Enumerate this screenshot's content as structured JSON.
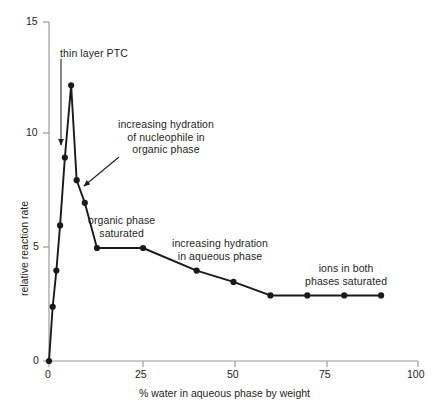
{
  "chart_data": {
    "type": "line",
    "title": "",
    "xlabel": "% water in aqueous phase by weight",
    "ylabel": "relative reaction rate",
    "xlim": [
      0,
      100
    ],
    "ylim": [
      0,
      15
    ],
    "xticks": [
      0,
      25,
      50,
      75,
      100
    ],
    "xtick_labels": [
      "0",
      "25",
      "50",
      "75",
      "100"
    ],
    "yticks": [
      0,
      5,
      10,
      15
    ],
    "ytick_labels": [
      "0",
      "5",
      "10",
      "15"
    ],
    "grid": false,
    "legend": "none",
    "marker": "filled-circle",
    "line_color": "#1a1a1a",
    "series": [
      {
        "name": "relative reaction rate",
        "x": [
          0,
          1,
          2,
          3,
          4.3,
          6,
          7.5,
          9.7,
          13,
          25.5,
          40,
          50,
          60,
          70,
          80,
          90
        ],
        "values": [
          0,
          2.4,
          4.0,
          6.0,
          9.0,
          12.2,
          8.0,
          7.0,
          5.0,
          5.0,
          4.0,
          3.5,
          2.9,
          2.9,
          2.9,
          2.9
        ]
      }
    ],
    "annotations": [
      {
        "id": "thin-layer-ptc",
        "text": "thin layer PTC",
        "arrow_from": [
          3.2,
          13.2
        ],
        "arrow_to": [
          3.2,
          9.6
        ]
      },
      {
        "id": "increasing-hydration-organic",
        "text": "increasing hydration\nof nucleophile in\norganic phase",
        "arrow_from": [
          19.0,
          9.6
        ],
        "arrow_to": [
          8.6,
          7.7
        ]
      },
      {
        "id": "organic-phase-saturated",
        "text": "organic phase\nsaturated",
        "arrow_from": null,
        "arrow_to": null
      },
      {
        "id": "increasing-hydration-aqueous",
        "text": "increasing hydration\nin aqueous phase",
        "arrow_from": null,
        "arrow_to": null
      },
      {
        "id": "ions-in-both-phases-saturated",
        "text": "ions in both\nphases saturated",
        "arrow_from": null,
        "arrow_to": null
      }
    ]
  },
  "annotation_lines": {
    "thin_layer_ptc": "thin layer PTC",
    "hydration_organic_1": "increasing hydration",
    "hydration_organic_2": "of nucleophile in",
    "hydration_organic_3": "organic phase",
    "organic_saturated_1": "organic phase",
    "organic_saturated_2": "saturated",
    "hydration_aqueous_1": "increasing hydration",
    "hydration_aqueous_2": "in aqueous phase",
    "ions_both_1": "ions in both",
    "ions_both_2": "phases saturated"
  },
  "axes": {
    "x_title": "% water in aqueous phase by weight",
    "y_title": "relative reaction rate",
    "x_tick_0": "0",
    "x_tick_25": "25",
    "x_tick_50": "50",
    "x_tick_75": "75",
    "x_tick_100": "100",
    "y_tick_0": "0",
    "y_tick_5": "5",
    "y_tick_10": "10",
    "y_tick_15": "15"
  },
  "colors": {
    "line": "#1a1a1a",
    "axis": "#8a8a8a",
    "text": "#231f20",
    "background": "#ffffff"
  }
}
